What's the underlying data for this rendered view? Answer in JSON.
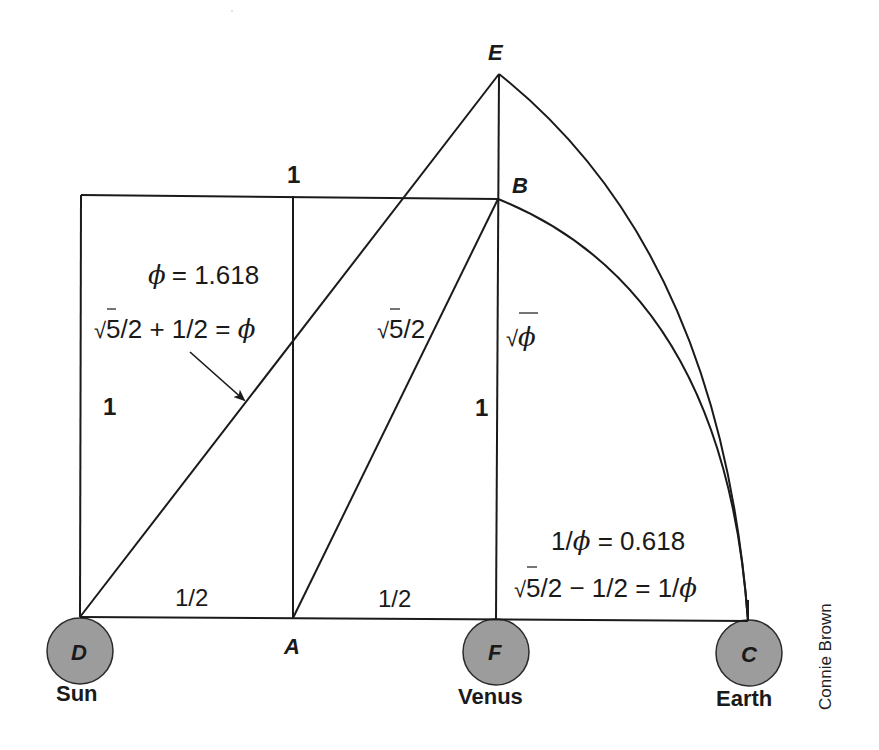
{
  "diagram": {
    "points": {
      "D": {
        "label": "D",
        "x": 80,
        "y": 617
      },
      "A": {
        "label": "A",
        "x": 293,
        "y": 618
      },
      "F": {
        "label": "F",
        "x": 496,
        "y": 620
      },
      "C": {
        "label": "C",
        "x": 748,
        "y": 621
      },
      "B": {
        "label": "B",
        "x": 498,
        "y": 199
      },
      "E": {
        "label": "E",
        "x": 499,
        "y": 74
      }
    },
    "bodies": {
      "sun": {
        "name": "Sun",
        "point": "D"
      },
      "venus": {
        "name": "Venus",
        "point": "F"
      },
      "earth": {
        "name": "Earth",
        "point": "C"
      }
    },
    "labels": {
      "top_side": "1",
      "left_side": "1",
      "fb_side": "1",
      "da_half": "1/2",
      "af_half": "1/2",
      "phi_value": "= 1.618",
      "phi_symbol": "ϕ",
      "phi_formula_a": "5/2 + 1/2 = ",
      "ab_length": "5/2",
      "fb_length": "ϕ",
      "inv_phi_value_prefix": "1/",
      "inv_phi_value": " = 0.618",
      "inv_phi_formula_a": "5/2 − 1/2 = 1/",
      "sqrt": "√"
    },
    "credit": "Connie Brown",
    "colors": {
      "line": "#1a1a1a",
      "planet_fill": "#9c9c9c",
      "background": "#ffffff"
    }
  }
}
